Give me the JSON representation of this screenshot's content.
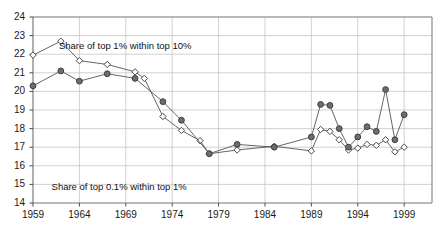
{
  "chart_data": {
    "type": "line",
    "title": "",
    "subtitle": "",
    "xlabel": "",
    "ylabel": "",
    "xlim": [
      1959,
      2002
    ],
    "ylim": [
      14,
      24
    ],
    "ytick_labels": [
      "24",
      "23",
      "22",
      "21",
      "20",
      "19",
      "18",
      "17",
      "16",
      "15",
      "14"
    ],
    "ytick_values": [
      24,
      23,
      22,
      21,
      20,
      19,
      18,
      17,
      16,
      15,
      14
    ],
    "xtick_labels": [
      "1959",
      "1964",
      "1969",
      "1974",
      "1979",
      "1984",
      "1989",
      "1994",
      "1999"
    ],
    "xtick_values": [
      1959,
      1964,
      1969,
      1974,
      1979,
      1984,
      1989,
      1994,
      1999
    ],
    "grid": true,
    "grid_axis": "both",
    "legend_position": "inline-annotation",
    "annotations": [
      {
        "text": "Share of top 1% within top 10%",
        "x": 1961.8,
        "y": 22.45
      },
      {
        "text": "Share of top 0.1% within top 1%",
        "x": 1961.0,
        "y": 14.85
      }
    ],
    "series": [
      {
        "name": "Share of top 1% within top 10%",
        "marker": "open-diamond",
        "color": "#555555",
        "fill": "#ffffff",
        "points": [
          {
            "x": 1959,
            "y": 21.95
          },
          {
            "x": 1962,
            "y": 22.7
          },
          {
            "x": 1964,
            "y": 21.65
          },
          {
            "x": 1967,
            "y": 21.45
          },
          {
            "x": 1970,
            "y": 21.05
          },
          {
            "x": 1971,
            "y": 20.7
          },
          {
            "x": 1973,
            "y": 18.65
          },
          {
            "x": 1975,
            "y": 17.9
          },
          {
            "x": 1977,
            "y": 17.35
          },
          {
            "x": 1978,
            "y": 16.65
          },
          {
            "x": 1981,
            "y": 16.85
          },
          {
            "x": 1985,
            "y": 17.05
          },
          {
            "x": 1989,
            "y": 16.8
          },
          {
            "x": 1990,
            "y": 17.95
          },
          {
            "x": 1991,
            "y": 17.85
          },
          {
            "x": 1992,
            "y": 17.4
          },
          {
            "x": 1993,
            "y": 16.85
          },
          {
            "x": 1994,
            "y": 16.95
          },
          {
            "x": 1995,
            "y": 17.15
          },
          {
            "x": 1996,
            "y": 17.1
          },
          {
            "x": 1997,
            "y": 17.4
          },
          {
            "x": 1998,
            "y": 16.75
          },
          {
            "x": 1999,
            "y": 17.0
          }
        ]
      },
      {
        "name": "Share of top 0.1% within top 1%",
        "marker": "filled-circle",
        "color": "#555555",
        "fill": "#6e6e6e",
        "points": [
          {
            "x": 1959,
            "y": 20.3
          },
          {
            "x": 1962,
            "y": 21.1
          },
          {
            "x": 1964,
            "y": 20.55
          },
          {
            "x": 1967,
            "y": 20.95
          },
          {
            "x": 1970,
            "y": 20.7
          },
          {
            "x": 1973,
            "y": 19.45
          },
          {
            "x": 1975,
            "y": 18.45
          },
          {
            "x": 1978,
            "y": 16.65
          },
          {
            "x": 1981,
            "y": 17.15
          },
          {
            "x": 1985,
            "y": 17.0
          },
          {
            "x": 1989,
            "y": 17.55
          },
          {
            "x": 1990,
            "y": 19.3
          },
          {
            "x": 1991,
            "y": 19.25
          },
          {
            "x": 1992,
            "y": 18.0
          },
          {
            "x": 1993,
            "y": 17.0
          },
          {
            "x": 1994,
            "y": 17.55
          },
          {
            "x": 1995,
            "y": 18.1
          },
          {
            "x": 1996,
            "y": 17.85
          },
          {
            "x": 1997,
            "y": 20.1
          },
          {
            "x": 1998,
            "y": 17.4
          },
          {
            "x": 1999,
            "y": 18.75
          }
        ]
      }
    ]
  }
}
